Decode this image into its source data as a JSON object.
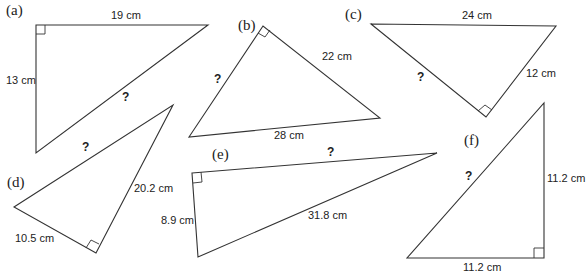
{
  "triangles": {
    "a": {
      "tag": "(a)",
      "side1": "19 cm",
      "side2": "13 cm",
      "unknown": "?"
    },
    "b": {
      "tag": "(b)",
      "side1": "22 cm",
      "side2": "28 cm",
      "unknown": "?"
    },
    "c": {
      "tag": "(c)",
      "side1": "24 cm",
      "side2": "12 cm",
      "unknown": "?"
    },
    "d": {
      "tag": "(d)",
      "side1": "20.2 cm",
      "side2": "10.5 cm",
      "unknown": "?"
    },
    "e": {
      "tag": "(e)",
      "side1": "8.9 cm",
      "side2": "31.8 cm",
      "unknown": "?"
    },
    "f": {
      "tag": "(f)",
      "side1": "11.2 cm",
      "side2": "11.2 cm",
      "unknown": "?"
    }
  }
}
